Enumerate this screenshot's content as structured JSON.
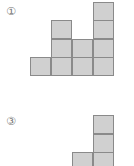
{
  "figures": [
    {
      "label": "①",
      "label_pos": [
        6,
        6
      ],
      "cell_color": "#d0d0d0",
      "cells": [
        [
          93,
          2
        ],
        [
          93,
          20
        ],
        [
          93,
          39
        ],
        [
          93,
          57
        ],
        [
          51,
          20
        ],
        [
          51,
          39
        ],
        [
          51,
          57
        ],
        [
          72,
          39
        ],
        [
          72,
          57
        ],
        [
          30,
          57
        ]
      ]
    },
    {
      "label": "③",
      "label_pos": [
        6,
        116
      ],
      "cell_color": "#d0d0d0",
      "cells": [
        [
          93,
          115
        ],
        [
          93,
          134
        ],
        [
          93,
          152
        ],
        [
          72,
          152
        ]
      ]
    }
  ]
}
